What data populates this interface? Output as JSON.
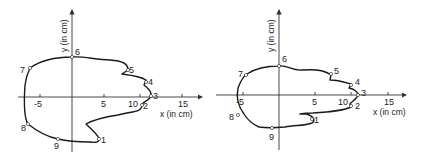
{
  "figure": {
    "panels": [
      {
        "id": "left",
        "x_axis_label": "x (in cm)",
        "y_axis_label": "y (in cm)",
        "x_ticks": [
          "-5",
          "5",
          "10",
          "15"
        ],
        "points": [
          "1",
          "2",
          "3",
          "4",
          "5",
          "6",
          "7",
          "8",
          "9"
        ]
      },
      {
        "id": "right",
        "x_axis_label": "x (in cm)",
        "y_axis_label": "y (in cm)",
        "x_ticks": [
          "-5",
          "5",
          "10",
          "15"
        ],
        "points": [
          "1",
          "2",
          "3",
          "4",
          "5",
          "6",
          "7",
          "8",
          "9"
        ]
      }
    ],
    "colors": {
      "curve": "#1a1a1a",
      "axis": "#333333",
      "background": "#ffffff"
    }
  }
}
